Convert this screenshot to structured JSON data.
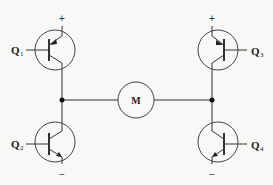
{
  "diagram": {
    "type": "H-bridge motor driver circuit",
    "transistors": [
      {
        "id": "Q1",
        "label": "Q",
        "sub": "1",
        "type": "PNP",
        "position": "top-left",
        "supply": "+"
      },
      {
        "id": "Q3",
        "label": "Q",
        "sub": "3",
        "type": "PNP",
        "position": "top-right",
        "supply": "+"
      },
      {
        "id": "Q2",
        "label": "Q",
        "sub": "2",
        "type": "NPN",
        "position": "bottom-left",
        "supply": "−"
      },
      {
        "id": "Q4",
        "label": "Q",
        "sub": "4",
        "type": "NPN",
        "position": "bottom-right",
        "supply": "−"
      }
    ],
    "motor": {
      "label": "M"
    },
    "colors": {
      "line": "#333333",
      "background": "#f8f8f6"
    }
  }
}
